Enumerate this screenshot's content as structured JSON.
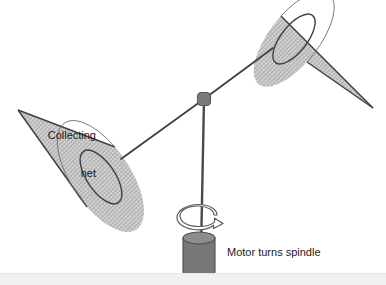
{
  "figure": {
    "type": "mechanical-apparatus-diagram",
    "canvas": {
      "width": 386,
      "height": 285,
      "background": "#ffffff"
    },
    "labels": {
      "collecting_net": {
        "line_1": "Collecting",
        "line_2": "net"
      },
      "motor_spindle": "Motor turns spindle"
    },
    "colors": {
      "outline": "#3f3f44",
      "cone_fill": "#d2d2d2",
      "cone_hatch": "#a8a8a8",
      "rod": "#4a4a50",
      "pivot_hub": "#7a7a7a",
      "pivot_hub_outline": "#55555a",
      "cylinder_body": "#787878",
      "cylinder_top": "#8d8d8d",
      "cylinder_outline": "#4d4d52",
      "arrow_stroke": "#5a5a5f",
      "arrow_fill": "#ffffff",
      "bottom_band": "#f1f1f1",
      "text": "#1a1a1a"
    },
    "parts": {
      "pivot_hub": {
        "cx": 204,
        "cy": 99,
        "r": 6.5
      },
      "spindle_rod": {
        "x": 204,
        "y_top": 99,
        "y_bottom": 250
      },
      "left_arm": {
        "x1": 204,
        "y1": 99,
        "x2": 124,
        "y2": 158
      },
      "right_arm": {
        "x1": 204,
        "y1": 99,
        "x2": 272,
        "y2": 49
      },
      "left_cone": {
        "apex_x": 18,
        "apex_y": 110,
        "mouth_cx": 101,
        "mouth_cy": 177,
        "mouth_rx": 14,
        "mouth_ry": 30,
        "mouth_rotation_deg": -34
      },
      "right_cone": {
        "apex_x": 373,
        "apex_y": 108,
        "mouth_cx": 294,
        "mouth_cy": 39,
        "mouth_rx": 13,
        "mouth_ry": 30,
        "mouth_rotation_deg": 38
      },
      "motor_cylinder": {
        "cx": 199,
        "top_y": 238,
        "bottom_y": 272,
        "rx": 16,
        "ry": 6
      },
      "rotation_arrow": {
        "cx": 200,
        "cy": 222,
        "rx": 19,
        "ry": 8,
        "direction": "clockwise-helical"
      }
    }
  }
}
